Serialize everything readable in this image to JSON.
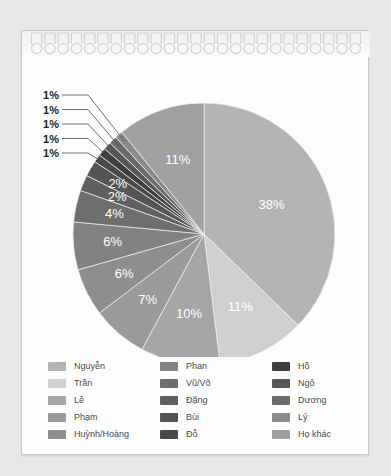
{
  "card": {
    "binding_icon": "spiral-binding-icon",
    "ring_count": 25
  },
  "chart_data": {
    "type": "pie",
    "title": "",
    "subtitle": "",
    "xlabel": "",
    "ylabel": "",
    "legend_position": "bottom",
    "grid": false,
    "unit": "%",
    "start_angle_deg": 0,
    "direction": "clockwise",
    "categories": [
      "Nguyễn",
      "Trần",
      "Lê",
      "Phạm",
      "Huỳnh/Hoàng",
      "Phan",
      "Vũ/Võ",
      "Đặng",
      "Bùi",
      "Đỗ",
      "Hồ",
      "Ngô",
      "Dương",
      "Lý",
      "Họ khác"
    ],
    "values": [
      38,
      11,
      10,
      7,
      6,
      6,
      4,
      2,
      2,
      1,
      1,
      1,
      1,
      1,
      11
    ],
    "labels": [
      "38%",
      "11%",
      "10%",
      "7%",
      "6%",
      "6%",
      "4%",
      "2%",
      "2%",
      "1%",
      "1%",
      "1%",
      "1%",
      "1%",
      "11%"
    ],
    "colors": [
      "#b4b4b4",
      "#cfcfcf",
      "#a6a6a6",
      "#9a9a9a",
      "#8e8e8e",
      "#828282",
      "#6e6e6e",
      "#5f5f5f",
      "#545454",
      "#494949",
      "#3e3e3e",
      "#565656",
      "#6a6a6a",
      "#8a8a8a",
      "#a0a0a0"
    ],
    "label_placement": [
      "inside",
      "inside",
      "inside",
      "inside",
      "inside",
      "inside",
      "inside",
      "inside",
      "inside",
      "callout",
      "callout",
      "callout",
      "callout",
      "callout",
      "inside"
    ]
  },
  "legend": {
    "columns": [
      {
        "items": [
          {
            "label": "Nguyễn",
            "color": "#b4b4b4"
          },
          {
            "label": "Trần",
            "color": "#cfcfcf"
          },
          {
            "label": "Lê",
            "color": "#a6a6a6"
          },
          {
            "label": "Phạm",
            "color": "#9a9a9a"
          },
          {
            "label": "Huỳnh/Hoàng",
            "color": "#8e8e8e"
          }
        ]
      },
      {
        "items": [
          {
            "label": "Phan",
            "color": "#828282"
          },
          {
            "label": "Vũ/Võ",
            "color": "#6e6e6e"
          },
          {
            "label": "Đặng",
            "color": "#5f5f5f"
          },
          {
            "label": "Bùi",
            "color": "#545454"
          },
          {
            "label": "Đỗ",
            "color": "#494949"
          }
        ]
      },
      {
        "items": [
          {
            "label": "Hồ",
            "color": "#3e3e3e"
          },
          {
            "label": "Ngô",
            "color": "#565656"
          },
          {
            "label": "Dương",
            "color": "#6a6a6a"
          },
          {
            "label": "Lý",
            "color": "#8a8a8a"
          },
          {
            "label": "Họ khác",
            "color": "#a0a0a0"
          }
        ]
      }
    ]
  }
}
